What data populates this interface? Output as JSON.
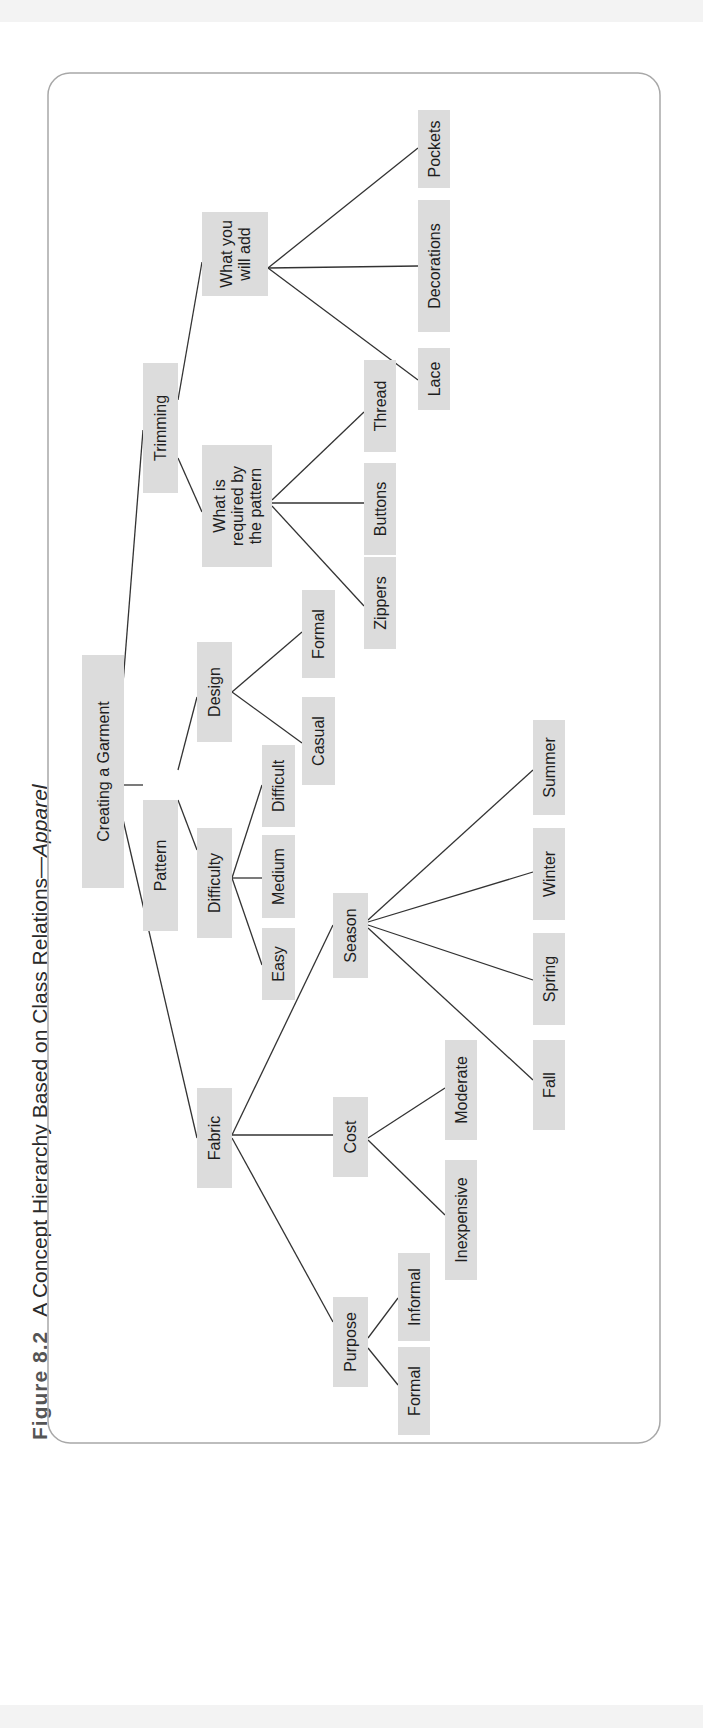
{
  "caption": {
    "figure_label": "Figure 8.2",
    "title": "A Concept Hierarchy Based on Class Relations—",
    "title_italic": "Apparel"
  },
  "colors": {
    "node_fill": "#dcdcdc",
    "edge": "#333333",
    "frame": "#a8a8a8",
    "text": "#1e1e1e"
  },
  "diagram": {
    "orientation": "rotated-90-ccw",
    "nodes": [
      {
        "id": "root",
        "lines": [
          "Creating a Garment"
        ],
        "x": 82,
        "y": 655,
        "w": 42,
        "h": 233
      },
      {
        "id": "trimming",
        "lines": [
          "Trimming"
        ],
        "x": 143,
        "y": 363,
        "w": 35,
        "h": 130
      },
      {
        "id": "pattern",
        "lines": [
          "Pattern"
        ],
        "x": 143,
        "y": 800,
        "w": 35,
        "h": 131
      },
      {
        "id": "fabric",
        "lines": [
          "Fabric"
        ],
        "x": 197,
        "y": 1088,
        "w": 35,
        "h": 100
      },
      {
        "id": "add",
        "lines": [
          "What you",
          "will add"
        ],
        "x": 202,
        "y": 212,
        "w": 66,
        "h": 84
      },
      {
        "id": "required",
        "lines": [
          "What is",
          "required by",
          "the pattern"
        ],
        "x": 202,
        "y": 445,
        "w": 70,
        "h": 122
      },
      {
        "id": "pockets",
        "lines": [
          "Pockets"
        ],
        "x": 418,
        "y": 110,
        "w": 32,
        "h": 78
      },
      {
        "id": "decorations",
        "lines": [
          "Decorations"
        ],
        "x": 418,
        "y": 200,
        "w": 32,
        "h": 132
      },
      {
        "id": "lace",
        "lines": [
          "Lace"
        ],
        "x": 418,
        "y": 348,
        "w": 32,
        "h": 62
      },
      {
        "id": "thread",
        "lines": [
          "Thread"
        ],
        "x": 364,
        "y": 360,
        "w": 32,
        "h": 92
      },
      {
        "id": "buttons",
        "lines": [
          "Buttons"
        ],
        "x": 364,
        "y": 463,
        "w": 32,
        "h": 92
      },
      {
        "id": "zippers",
        "lines": [
          "Zippers"
        ],
        "x": 364,
        "y": 557,
        "w": 32,
        "h": 92
      },
      {
        "id": "design",
        "lines": [
          "Design"
        ],
        "x": 197,
        "y": 642,
        "w": 35,
        "h": 100
      },
      {
        "id": "difficulty",
        "lines": [
          "Difficulty"
        ],
        "x": 197,
        "y": 828,
        "w": 35,
        "h": 110
      },
      {
        "id": "formal_design",
        "lines": [
          "Formal"
        ],
        "x": 302,
        "y": 590,
        "w": 33,
        "h": 88
      },
      {
        "id": "casual",
        "lines": [
          "Casual"
        ],
        "x": 302,
        "y": 697,
        "w": 33,
        "h": 88
      },
      {
        "id": "difficult",
        "lines": [
          "Difficult"
        ],
        "x": 262,
        "y": 745,
        "w": 33,
        "h": 82
      },
      {
        "id": "medium",
        "lines": [
          "Medium"
        ],
        "x": 262,
        "y": 835,
        "w": 33,
        "h": 83
      },
      {
        "id": "easy",
        "lines": [
          "Easy"
        ],
        "x": 262,
        "y": 928,
        "w": 33,
        "h": 72
      },
      {
        "id": "season",
        "lines": [
          "Season"
        ],
        "x": 333,
        "y": 893,
        "w": 35,
        "h": 85
      },
      {
        "id": "cost",
        "lines": [
          "Cost"
        ],
        "x": 333,
        "y": 1097,
        "w": 35,
        "h": 80
      },
      {
        "id": "purpose",
        "lines": [
          "Purpose"
        ],
        "x": 333,
        "y": 1297,
        "w": 35,
        "h": 90
      },
      {
        "id": "summer",
        "lines": [
          "Summer"
        ],
        "x": 533,
        "y": 720,
        "w": 32,
        "h": 95
      },
      {
        "id": "winter",
        "lines": [
          "Winter"
        ],
        "x": 533,
        "y": 828,
        "w": 32,
        "h": 92
      },
      {
        "id": "spring",
        "lines": [
          "Spring"
        ],
        "x": 533,
        "y": 933,
        "w": 32,
        "h": 92
      },
      {
        "id": "fall",
        "lines": [
          "Fall"
        ],
        "x": 533,
        "y": 1040,
        "w": 32,
        "h": 90
      },
      {
        "id": "moderate",
        "lines": [
          "Moderate"
        ],
        "x": 445,
        "y": 1040,
        "w": 32,
        "h": 100
      },
      {
        "id": "inexpensive",
        "lines": [
          "Inexpensive"
        ],
        "x": 445,
        "y": 1160,
        "w": 32,
        "h": 120
      },
      {
        "id": "informal",
        "lines": [
          "Informal"
        ],
        "x": 398,
        "y": 1253,
        "w": 32,
        "h": 88
      },
      {
        "id": "formal_purpose",
        "lines": [
          "Formal"
        ],
        "x": 398,
        "y": 1347,
        "w": 32,
        "h": 88
      }
    ],
    "edges": [
      {
        "from": [
          115,
          785
        ],
        "to": [
          143,
          430
        ]
      },
      {
        "from": [
          115,
          785
        ],
        "to": [
          143,
          785
        ]
      },
      {
        "from": [
          115,
          785
        ],
        "to": [
          197,
          1138
        ]
      },
      {
        "from": [
          178,
          400
        ],
        "to": [
          202,
          262
        ]
      },
      {
        "from": [
          178,
          458
        ],
        "to": [
          202,
          512
        ]
      },
      {
        "from": [
          268,
          268
        ],
        "to": [
          418,
          148
        ]
      },
      {
        "from": [
          268,
          268
        ],
        "to": [
          418,
          266
        ]
      },
      {
        "from": [
          268,
          268
        ],
        "to": [
          418,
          380
        ]
      },
      {
        "from": [
          272,
          500
        ],
        "to": [
          364,
          412
        ]
      },
      {
        "from": [
          272,
          503
        ],
        "to": [
          364,
          503
        ]
      },
      {
        "from": [
          272,
          506
        ],
        "to": [
          364,
          606
        ]
      },
      {
        "from": [
          178,
          770
        ],
        "to": [
          197,
          697
        ]
      },
      {
        "from": [
          178,
          800
        ],
        "to": [
          197,
          850
        ]
      },
      {
        "from": [
          232,
          692
        ],
        "to": [
          302,
          632
        ]
      },
      {
        "from": [
          232,
          692
        ],
        "to": [
          302,
          743
        ]
      },
      {
        "from": [
          232,
          878
        ],
        "to": [
          262,
          785
        ]
      },
      {
        "from": [
          232,
          878
        ],
        "to": [
          262,
          878
        ]
      },
      {
        "from": [
          232,
          878
        ],
        "to": [
          262,
          965
        ]
      },
      {
        "from": [
          232,
          1135
        ],
        "to": [
          333,
          925
        ]
      },
      {
        "from": [
          232,
          1135
        ],
        "to": [
          333,
          1135
        ]
      },
      {
        "from": [
          232,
          1138
        ],
        "to": [
          333,
          1322
        ]
      },
      {
        "from": [
          368,
          920
        ],
        "to": [
          533,
          770
        ]
      },
      {
        "from": [
          368,
          922
        ],
        "to": [
          533,
          872
        ]
      },
      {
        "from": [
          368,
          925
        ],
        "to": [
          533,
          980
        ]
      },
      {
        "from": [
          368,
          928
        ],
        "to": [
          533,
          1080
        ]
      },
      {
        "from": [
          368,
          1138
        ],
        "to": [
          445,
          1088
        ]
      },
      {
        "from": [
          368,
          1140
        ],
        "to": [
          445,
          1215
        ]
      },
      {
        "from": [
          368,
          1338
        ],
        "to": [
          398,
          1298
        ]
      },
      {
        "from": [
          368,
          1348
        ],
        "to": [
          398,
          1385
        ]
      }
    ],
    "frame": {
      "x": 48,
      "y": 73,
      "w": 612,
      "h": 1370,
      "r": 22
    }
  }
}
